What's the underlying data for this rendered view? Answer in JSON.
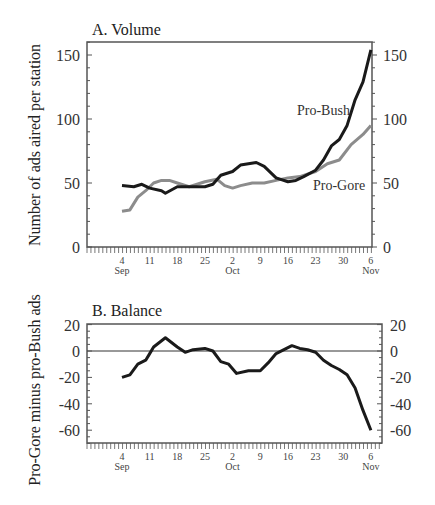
{
  "chart_data": [
    {
      "type": "line",
      "title": "A. Volume",
      "xlabel": "",
      "ylabel": "Number of ads aired per station",
      "ylim": [
        0,
        160
      ],
      "yticks": [
        0,
        50,
        100,
        150
      ],
      "x_tick_labels": [
        "4",
        "11",
        "18",
        "25",
        "2",
        "9",
        "16",
        "23",
        "30",
        "6"
      ],
      "x_month_labels": [
        {
          "label": "Sep",
          "at": "4"
        },
        {
          "label": "Oct",
          "at": "2"
        },
        {
          "label": "Nov",
          "at": "6"
        }
      ],
      "x": [
        "Sep 4",
        "Sep 7",
        "Sep 9",
        "Sep 11",
        "Sep 14",
        "Sep 15",
        "Sep 18",
        "Sep 21",
        "Sep 25",
        "Sep 27",
        "Sep 29",
        "Oct 2",
        "Oct 4",
        "Oct 6",
        "Oct 8",
        "Oct 10",
        "Oct 13",
        "Oct 16",
        "Oct 18",
        "Oct 20",
        "Oct 23",
        "Oct 25",
        "Oct 27",
        "Oct 29",
        "Oct 31",
        "Nov 2",
        "Nov 4",
        "Nov 6"
      ],
      "series": [
        {
          "name": "Pro-Bush",
          "color": "#1a1a1a",
          "x_day": [
            0,
            3,
            5,
            7,
            10,
            11,
            14,
            17,
            21,
            23,
            25,
            28,
            30,
            32,
            34,
            36,
            39,
            42,
            44,
            46,
            49,
            51,
            53,
            55,
            57,
            59,
            61,
            63
          ],
          "values": [
            48,
            47,
            49,
            46,
            44,
            42,
            47,
            47,
            47,
            49,
            56,
            59,
            64,
            65,
            66,
            63,
            54,
            51,
            52,
            55,
            60,
            68,
            79,
            84,
            95,
            115,
            129,
            154
          ]
        },
        {
          "name": "Pro-Gore",
          "color": "#8c8c8c",
          "x_day": [
            0,
            2,
            4,
            6,
            8,
            10,
            12,
            14,
            17,
            21,
            24,
            26,
            28,
            30,
            33,
            36,
            39,
            42,
            45,
            49,
            52,
            55,
            58,
            61,
            63
          ],
          "values": [
            28,
            29,
            39,
            44,
            50,
            52,
            52,
            50,
            47,
            51,
            53,
            48,
            46,
            48,
            50,
            50,
            52,
            54,
            55,
            59,
            65,
            68,
            80,
            88,
            95
          ]
        }
      ],
      "annotations": [
        "Pro-Bush",
        "Pro-Gore"
      ],
      "grid": false,
      "legend": "inline labels"
    },
    {
      "type": "line",
      "title": "B. Balance",
      "xlabel": "",
      "ylabel": "Pro-Gore minus pro-Bush ads",
      "ylim": [
        -70,
        20
      ],
      "yticks": [
        -60,
        -40,
        -20,
        0,
        20
      ],
      "x_tick_labels": [
        "4",
        "11",
        "18",
        "25",
        "2",
        "9",
        "16",
        "23",
        "30",
        "6"
      ],
      "x_month_labels": [
        {
          "label": "Sep",
          "at": "4"
        },
        {
          "label": "Oct",
          "at": "2"
        },
        {
          "label": "Nov",
          "at": "6"
        }
      ],
      "reference_line": 0,
      "series": [
        {
          "name": "Balance",
          "color": "#1a1a1a",
          "x_day": [
            0,
            2,
            4,
            6,
            7,
            8,
            11,
            14,
            16,
            18,
            21,
            23,
            25,
            27,
            29,
            32,
            35,
            37,
            39,
            41,
            43,
            45,
            47,
            49,
            51,
            53,
            55,
            57,
            59,
            61,
            63
          ],
          "values": [
            -20,
            -18,
            -10,
            -7,
            -2,
            3,
            10,
            3,
            -1,
            1,
            2,
            0,
            -8,
            -10,
            -17,
            -15,
            -15,
            -9,
            -2,
            1,
            4,
            2,
            1,
            -1,
            -7,
            -11,
            -14,
            -18,
            -28,
            -45,
            -60
          ]
        }
      ],
      "grid": false
    }
  ],
  "panels": {
    "volume": {
      "title": "A. Volume",
      "ylabel": "Number of ads aired per station",
      "label_bush": "Pro-Bush",
      "label_gore": "Pro-Gore",
      "yticks": [
        "0",
        "50",
        "100",
        "150"
      ]
    },
    "balance": {
      "title": "B. Balance",
      "ylabel": "Pro-Gore minus pro-Bush ads",
      "yticks": [
        "20",
        "0",
        "-20",
        "-40",
        "-60"
      ]
    },
    "x_ticks": [
      "4",
      "11",
      "18",
      "25",
      "2",
      "9",
      "16",
      "23",
      "30",
      "6"
    ],
    "months": [
      "Sep",
      "Oct",
      "Nov"
    ]
  }
}
